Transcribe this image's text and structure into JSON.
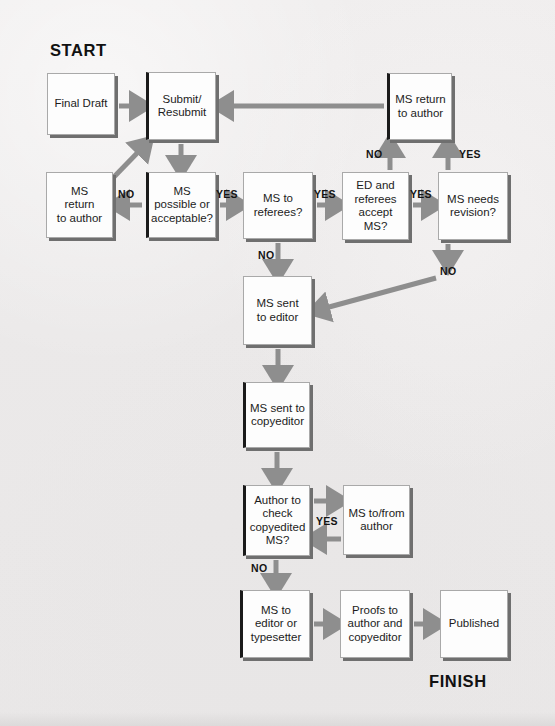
{
  "figure": {
    "start_label": "START",
    "finish_label": "FINISH",
    "arrow_color": "#8e8e8e",
    "box_fill": "#fdfdfd",
    "box_border": "#a9a9a9",
    "box_shadow": "#6f6f6f",
    "background": "#eceaea",
    "text_color": "#1c1c1c"
  },
  "nodes": [
    {
      "id": "final-draft",
      "label": "Final Draft",
      "x": 47,
      "y": 73,
      "w": 68,
      "h": 62,
      "dark_left": false
    },
    {
      "id": "submit-resubmit",
      "label": "Submit/\nResubmit",
      "x": 146,
      "y": 72,
      "w": 70,
      "h": 68,
      "dark_left": true
    },
    {
      "id": "ms-return-author-1",
      "label": "MS return\nto author",
      "x": 387,
      "y": 73,
      "w": 65,
      "h": 67,
      "dark_left": true
    },
    {
      "id": "ms-return-author-2",
      "label": "MS\nreturn\nto author",
      "x": 46,
      "y": 172,
      "w": 67,
      "h": 66,
      "dark_left": false
    },
    {
      "id": "ms-possible",
      "label": "MS\npossible or\nacceptable?",
      "x": 146,
      "y": 172,
      "w": 70,
      "h": 66,
      "dark_left": true
    },
    {
      "id": "ms-to-referees",
      "label": "MS to\nreferees?",
      "x": 243,
      "y": 172,
      "w": 70,
      "h": 67,
      "dark_left": false
    },
    {
      "id": "ed-referees-accept",
      "label": "ED and\nreferees\naccept MS?",
      "x": 342,
      "y": 172,
      "w": 67,
      "h": 68,
      "dark_left": false
    },
    {
      "id": "ms-needs-revision",
      "label": "MS needs\nrevision?",
      "x": 438,
      "y": 172,
      "w": 70,
      "h": 68,
      "dark_left": false
    },
    {
      "id": "ms-sent-editor",
      "label": "MS sent\nto editor",
      "x": 243,
      "y": 276,
      "w": 69,
      "h": 69,
      "dark_left": false
    },
    {
      "id": "ms-sent-copyeditor",
      "label": "MS sent to\ncopyeditor",
      "x": 243,
      "y": 382,
      "w": 67,
      "h": 66,
      "dark_left": true
    },
    {
      "id": "author-check",
      "label": "Author to\ncheck\ncopyedited\nMS?",
      "x": 243,
      "y": 485,
      "w": 67,
      "h": 71,
      "dark_left": true
    },
    {
      "id": "ms-to-from-author",
      "label": "MS to/from\nauthor",
      "x": 343,
      "y": 485,
      "w": 67,
      "h": 70,
      "dark_left": false
    },
    {
      "id": "ms-to-typesetter",
      "label": "MS to\neditor or\ntypesetter",
      "x": 240,
      "y": 590,
      "w": 70,
      "h": 68,
      "dark_left": true
    },
    {
      "id": "proofs-to-author",
      "label": "Proofs to\nauthor and\ncopyeditor",
      "x": 340,
      "y": 590,
      "w": 70,
      "h": 68,
      "dark_left": false
    },
    {
      "id": "published",
      "label": "Published",
      "x": 440,
      "y": 590,
      "w": 68,
      "h": 68,
      "dark_left": false
    }
  ],
  "edge_labels": [
    {
      "id": "no-possible",
      "text": "NO",
      "x": 118,
      "y": 188
    },
    {
      "id": "yes-possible",
      "text": "YES",
      "x": 216,
      "y": 188
    },
    {
      "id": "yes-referees",
      "text": "YES",
      "x": 314,
      "y": 188
    },
    {
      "id": "yes-accept",
      "text": "YES",
      "x": 410,
      "y": 188
    },
    {
      "id": "no-accept",
      "text": "NO",
      "x": 366,
      "y": 148
    },
    {
      "id": "yes-revision",
      "text": "YES",
      "x": 459,
      "y": 148
    },
    {
      "id": "no-referees",
      "text": "NO",
      "x": 258,
      "y": 249
    },
    {
      "id": "no-revision",
      "text": "NO",
      "x": 440,
      "y": 265
    },
    {
      "id": "yes-author-check",
      "text": "YES",
      "x": 316,
      "y": 515
    },
    {
      "id": "no-author-check",
      "text": "NO",
      "x": 251,
      "y": 562
    }
  ],
  "terminals": [
    {
      "id": "start",
      "text": "START",
      "x": 50,
      "y": 41
    },
    {
      "id": "finish",
      "text": "FINISH",
      "x": 429,
      "y": 672
    }
  ],
  "chart_data": {
    "type": "diagram",
    "nodes": [
      "Final Draft",
      "Submit/Resubmit",
      "MS return to author (top)",
      "MS return to author (left)",
      "MS possible or acceptable?",
      "MS to referees?",
      "ED and referees accept MS?",
      "MS needs revision?",
      "MS sent to editor",
      "MS sent to copyeditor",
      "Author to check copyedited MS?",
      "MS to/from author",
      "MS to editor or typesetter",
      "Proofs to author and copyeditor",
      "Published"
    ],
    "edges": [
      {
        "from": "Final Draft",
        "to": "Submit/Resubmit",
        "label": ""
      },
      {
        "from": "Submit/Resubmit",
        "to": "MS possible or acceptable?",
        "label": ""
      },
      {
        "from": "MS possible or acceptable?",
        "to": "MS return to author (left)",
        "label": "NO"
      },
      {
        "from": "MS return to author (left)",
        "to": "Submit/Resubmit",
        "label": ""
      },
      {
        "from": "MS possible or acceptable?",
        "to": "MS to referees?",
        "label": "YES"
      },
      {
        "from": "MS to referees?",
        "to": "ED and referees accept MS?",
        "label": "YES"
      },
      {
        "from": "MS to referees?",
        "to": "MS sent to editor",
        "label": "NO"
      },
      {
        "from": "ED and referees accept MS?",
        "to": "MS return to author (top)",
        "label": "NO"
      },
      {
        "from": "ED and referees accept MS?",
        "to": "MS needs revision?",
        "label": "YES"
      },
      {
        "from": "MS needs revision?",
        "to": "MS return to author (top)",
        "label": "YES"
      },
      {
        "from": "MS needs revision?",
        "to": "MS sent to editor",
        "label": "NO"
      },
      {
        "from": "MS return to author (top)",
        "to": "Submit/Resubmit",
        "label": ""
      },
      {
        "from": "MS sent to editor",
        "to": "MS sent to copyeditor",
        "label": ""
      },
      {
        "from": "MS sent to copyeditor",
        "to": "Author to check copyedited MS?",
        "label": ""
      },
      {
        "from": "Author to check copyedited MS?",
        "to": "MS to/from author",
        "label": "YES"
      },
      {
        "from": "MS to/from author",
        "to": "Author to check copyedited MS?",
        "label": ""
      },
      {
        "from": "Author to check copyedited MS?",
        "to": "MS to editor or typesetter",
        "label": "NO"
      },
      {
        "from": "MS to editor or typesetter",
        "to": "Proofs to author and copyeditor",
        "label": ""
      },
      {
        "from": "Proofs to author and copyeditor",
        "to": "Published",
        "label": ""
      }
    ],
    "start": "START",
    "finish": "FINISH"
  }
}
